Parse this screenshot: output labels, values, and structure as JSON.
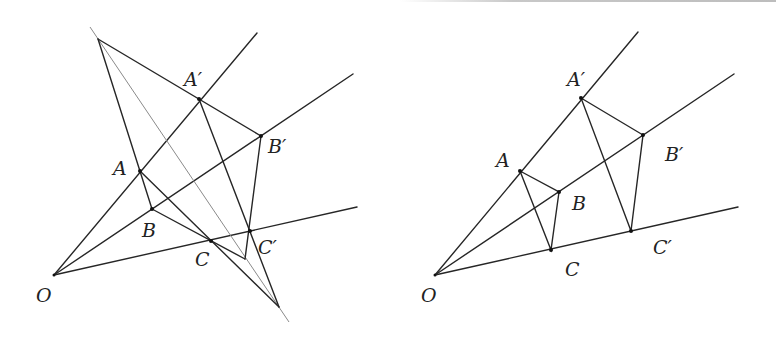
{
  "figures": [
    {
      "id": "left",
      "title": "Desargues configuration (perspective triangles with intersecting sides)",
      "labels": {
        "O": "O",
        "A": "A",
        "B": "B",
        "C": "C",
        "A2": "A′",
        "B2": "B′",
        "C2": "C′"
      },
      "points": {
        "O": [
          54,
          275
        ],
        "A": [
          140,
          171
        ],
        "B": [
          152,
          209
        ],
        "C": [
          211,
          241
        ],
        "A2": [
          199,
          99
        ],
        "B2": [
          261,
          136
        ],
        "C2": [
          250,
          231
        ],
        "P": [
          98,
          39
        ],
        "Q": [
          279,
          307
        ],
        "R": [
          245,
          259
        ]
      }
    },
    {
      "id": "right",
      "title": "Perspective triangles ABC and A′B′C′ from centre O",
      "labels": {
        "O": "O",
        "A": "A",
        "B": "B",
        "C": "C",
        "A2": "A′",
        "B2": "B′",
        "C2": "C′"
      },
      "points": {
        "O": [
          435,
          275
        ],
        "A": [
          520,
          171
        ],
        "B": [
          559,
          192
        ],
        "C": [
          551,
          250
        ],
        "A2": [
          581,
          98
        ],
        "B2": [
          643,
          135
        ],
        "C2": [
          631,
          231
        ]
      }
    }
  ],
  "colors": {
    "line": "#262626",
    "thin_line": "#8a8a8a",
    "background": "#ffffff"
  }
}
